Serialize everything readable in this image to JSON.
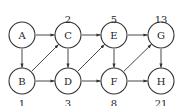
{
  "diagram": {
    "type": "directed-graph",
    "nodes": [
      {
        "id": "A",
        "label": "A",
        "x": 22,
        "y": 35,
        "weight": ""
      },
      {
        "id": "B",
        "label": "B",
        "x": 22,
        "y": 81,
        "weight": "1",
        "weight_pos": "below"
      },
      {
        "id": "C",
        "label": "C",
        "x": 68,
        "y": 35,
        "weight": "2",
        "weight_pos": "above"
      },
      {
        "id": "D",
        "label": "D",
        "x": 68,
        "y": 81,
        "weight": "3",
        "weight_pos": "below"
      },
      {
        "id": "E",
        "label": "E",
        "x": 114,
        "y": 35,
        "weight": "5",
        "weight_pos": "above"
      },
      {
        "id": "F",
        "label": "F",
        "x": 114,
        "y": 81,
        "weight": "8",
        "weight_pos": "below"
      },
      {
        "id": "G",
        "label": "G",
        "x": 161,
        "y": 35,
        "weight": "13",
        "weight_pos": "above"
      },
      {
        "id": "H",
        "label": "H",
        "x": 161,
        "y": 81,
        "weight": "21",
        "weight_pos": "below"
      }
    ],
    "edges": [
      {
        "from": "A",
        "to": "C"
      },
      {
        "from": "A",
        "to": "B"
      },
      {
        "from": "B",
        "to": "C"
      },
      {
        "from": "B",
        "to": "D"
      },
      {
        "from": "C",
        "to": "E"
      },
      {
        "from": "C",
        "to": "D"
      },
      {
        "from": "D",
        "to": "E"
      },
      {
        "from": "D",
        "to": "F"
      },
      {
        "from": "E",
        "to": "G"
      },
      {
        "from": "E",
        "to": "F"
      },
      {
        "from": "F",
        "to": "G"
      },
      {
        "from": "F",
        "to": "H"
      },
      {
        "from": "G",
        "to": "H"
      }
    ],
    "node_radius": 13
  }
}
